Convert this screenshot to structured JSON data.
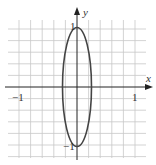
{
  "chart_data": {
    "type": "line",
    "title": "",
    "equation": "16x^2 + y^2 = 1",
    "xlabel": "x",
    "ylabel": "y",
    "x_ticks": [
      {
        "value": -1,
        "label": "-1"
      },
      {
        "value": 1,
        "label": "1"
      }
    ],
    "y_ticks": [
      {
        "value": 1,
        "label": "1"
      },
      {
        "value": -1,
        "label": "-1"
      }
    ],
    "grid": true,
    "grid_step": 0.2,
    "xlim": [
      -1.2,
      1.3
    ],
    "ylim": [
      -1.3,
      1.4
    ],
    "series": [
      {
        "name": "ellipse",
        "semi_axis_x": 0.25,
        "semi_axis_y": 1,
        "center": [
          0,
          0
        ]
      }
    ]
  },
  "labels": {
    "x_axis": "x",
    "y_axis": "y",
    "x_neg_one": "−1",
    "x_pos_one": "1",
    "y_pos_one": "1",
    "y_neg_one": "−1"
  },
  "colors": {
    "grid": "#c8c8c8",
    "axis": "#222222",
    "curve": "#444444"
  }
}
